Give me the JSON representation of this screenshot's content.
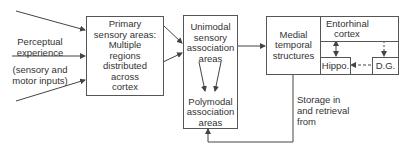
{
  "diagram": {
    "input_label": {
      "line1": "Perceptual",
      "line2": "experience",
      "line3": "(sensory and",
      "line4": "motor inputs)"
    },
    "primary_box": {
      "lines": [
        "Primary",
        "sensory areas:",
        "Multiple",
        "regions",
        "distributed",
        "across",
        "cortex"
      ]
    },
    "association_box": {
      "unimodal_lines": [
        "Unimodal",
        "sensory",
        "association",
        "areas"
      ],
      "polymodal_lines": [
        "Polymodal",
        "association",
        "areas"
      ]
    },
    "medial_temporal_box": {
      "lines": [
        "Medial",
        "temporal",
        "structures"
      ]
    },
    "entorhinal_box": {
      "lines": [
        "Entorhinal",
        "cortex"
      ]
    },
    "hippo_box": {
      "label": "Hippo."
    },
    "dg_box": {
      "label": "D.G."
    },
    "feedback_label": {
      "lines": [
        "Storage in",
        "and retrieval",
        "from"
      ]
    },
    "colors": {
      "line": "#444444",
      "text": "#333333",
      "background": "#ffffff"
    }
  }
}
